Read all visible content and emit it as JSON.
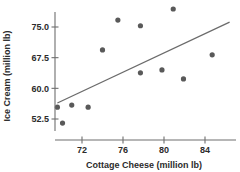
{
  "chart_data": {
    "type": "scatter",
    "title": "",
    "xlabel": "Cottage Cheese (million lb)",
    "ylabel": "Ice Cream (million lb)",
    "xticks": [
      72,
      76,
      80,
      84
    ],
    "yticks": [
      52.5,
      60.0,
      67.5,
      75.0
    ],
    "xticklabels": [
      "72",
      "76",
      "80",
      "84"
    ],
    "yticklabels": [
      "52.5",
      "60.0",
      "67.5",
      "75.0"
    ],
    "xlim": [
      68.8,
      86.5
    ],
    "ylim": [
      49.0,
      81.5
    ],
    "grid": false,
    "legend": null,
    "point_color": "#595959",
    "line_color": "#6b6b6b",
    "axis_color": "#6e6e6e",
    "points": [
      {
        "x": 69.6,
        "y": 55.4
      },
      {
        "x": 70.1,
        "y": 51.5
      },
      {
        "x": 71.0,
        "y": 55.9
      },
      {
        "x": 72.6,
        "y": 55.4
      },
      {
        "x": 74.0,
        "y": 69.4
      },
      {
        "x": 75.5,
        "y": 76.7
      },
      {
        "x": 77.7,
        "y": 75.3
      },
      {
        "x": 77.7,
        "y": 63.8
      },
      {
        "x": 79.8,
        "y": 64.5
      },
      {
        "x": 80.9,
        "y": 79.4
      },
      {
        "x": 81.9,
        "y": 62.3
      },
      {
        "x": 84.7,
        "y": 68.2
      }
    ],
    "trendline": {
      "x1": 69.6,
      "y1": 56.4,
      "x2": 86.4,
      "y2": 76.2
    }
  },
  "labels": {
    "x_axis_title": "Cottage Cheese (million lb)",
    "y_axis_title": "Ice Cream (million lb)"
  }
}
